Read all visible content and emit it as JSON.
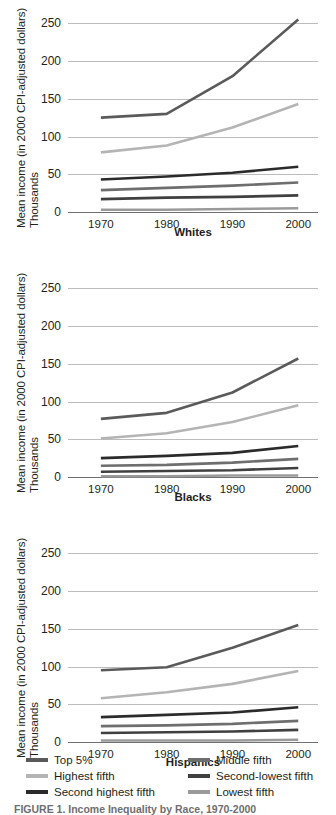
{
  "figure": {
    "y_axis_label_line1": "Mean income (in 2000 CPI-adjusted dollars)",
    "y_axis_label_line2": "Thousands",
    "caption": "FIGURE 1. Income Inequality by Race, 1970-2000"
  },
  "legend": {
    "items": [
      {
        "label": "Top 5%",
        "color": "#5a5a5a",
        "column": "left"
      },
      {
        "label": "Highest fifth",
        "color": "#b4b4b4",
        "column": "left"
      },
      {
        "label": "Second highest fifth",
        "color": "#2b2b2b",
        "column": "left"
      },
      {
        "label": "Middle fifth",
        "color": "#6e6e6e",
        "column": "right"
      },
      {
        "label": "Second-lowest fifth",
        "color": "#404040",
        "column": "right"
      },
      {
        "label": "Lowest fifth",
        "color": "#9a9a9a",
        "column": "right"
      }
    ]
  },
  "chart_data": [
    {
      "type": "line",
      "title": "Whites",
      "xlabel": "",
      "ylabel": "Mean income (in 2000 CPI-adjusted dollars) Thousands",
      "x": [
        1970,
        1980,
        1990,
        2000
      ],
      "xticklabels": [
        "1970",
        "1980",
        "1990",
        "2000"
      ],
      "yticks": [
        0,
        50,
        100,
        150,
        200,
        250
      ],
      "yticklabels": [
        "0",
        "50",
        "100",
        "150",
        "200",
        "250"
      ],
      "ylim": [
        0,
        265
      ],
      "xlim": [
        1965,
        2003
      ],
      "grid": true,
      "legend_position": "bottom",
      "series": [
        {
          "name": "Top 5%",
          "color": "#5a5a5a",
          "width": 2.6,
          "values": [
            125,
            130,
            180,
            255
          ]
        },
        {
          "name": "Highest fifth",
          "color": "#b4b4b4",
          "width": 2.6,
          "values": [
            79,
            88,
            112,
            143
          ]
        },
        {
          "name": "Second highest fifth",
          "color": "#2b2b2b",
          "width": 2.6,
          "values": [
            43,
            47,
            52,
            60
          ]
        },
        {
          "name": "Middle fifth",
          "color": "#6e6e6e",
          "width": 2.6,
          "values": [
            29,
            32,
            35,
            39
          ]
        },
        {
          "name": "Second-lowest fifth",
          "color": "#404040",
          "width": 2.6,
          "values": [
            17,
            19,
            20,
            22
          ]
        },
        {
          "name": "Lowest fifth",
          "color": "#9a9a9a",
          "width": 2.6,
          "values": [
            3,
            3,
            4,
            5
          ]
        }
      ]
    },
    {
      "type": "line",
      "title": "Blacks",
      "xlabel": "",
      "ylabel": "Mean income (in 2000 CPI-adjusted dollars) Thousands",
      "x": [
        1970,
        1980,
        1990,
        2000
      ],
      "xticklabels": [
        "1970",
        "1980",
        "1990",
        "2000"
      ],
      "yticks": [
        0,
        50,
        100,
        150,
        200,
        250
      ],
      "yticklabels": [
        "0",
        "50",
        "100",
        "150",
        "200",
        "250"
      ],
      "ylim": [
        0,
        265
      ],
      "xlim": [
        1965,
        2003
      ],
      "grid": true,
      "legend_position": "bottom",
      "series": [
        {
          "name": "Top 5%",
          "color": "#5a5a5a",
          "width": 2.6,
          "values": [
            77,
            85,
            112,
            157
          ]
        },
        {
          "name": "Highest fifth",
          "color": "#b4b4b4",
          "width": 2.6,
          "values": [
            51,
            58,
            73,
            95
          ]
        },
        {
          "name": "Second highest fifth",
          "color": "#2b2b2b",
          "width": 2.6,
          "values": [
            25,
            28,
            32,
            41
          ]
        },
        {
          "name": "Middle fifth",
          "color": "#6e6e6e",
          "width": 2.6,
          "values": [
            15,
            16,
            19,
            24
          ]
        },
        {
          "name": "Second-lowest fifth",
          "color": "#404040",
          "width": 2.6,
          "values": [
            7,
            8,
            9,
            12
          ]
        },
        {
          "name": "Lowest fifth",
          "color": "#9a9a9a",
          "width": 2.6,
          "values": [
            1,
            1,
            2,
            2
          ]
        }
      ]
    },
    {
      "type": "line",
      "title": "Hispanics",
      "xlabel": "",
      "ylabel": "Mean income (in 2000 CPI-adjusted dollars) Thousands",
      "x": [
        1970,
        1980,
        1990,
        2000
      ],
      "xticklabels": [
        "1970",
        "1980",
        "1990",
        "2000"
      ],
      "yticks": [
        0,
        50,
        100,
        150,
        200,
        250
      ],
      "yticklabels": [
        "0",
        "50",
        "100",
        "150",
        "200",
        "250"
      ],
      "ylim": [
        0,
        265
      ],
      "xlim": [
        1965,
        2003
      ],
      "grid": true,
      "legend_position": "bottom",
      "series": [
        {
          "name": "Top 5%",
          "color": "#5a5a5a",
          "width": 2.6,
          "values": [
            95,
            99,
            125,
            155
          ]
        },
        {
          "name": "Highest fifth",
          "color": "#b4b4b4",
          "width": 2.6,
          "values": [
            58,
            66,
            77,
            94
          ]
        },
        {
          "name": "Second highest fifth",
          "color": "#2b2b2b",
          "width": 2.6,
          "values": [
            33,
            36,
            39,
            46
          ]
        },
        {
          "name": "Middle fifth",
          "color": "#6e6e6e",
          "width": 2.6,
          "values": [
            21,
            22,
            24,
            28
          ]
        },
        {
          "name": "Second-lowest fifth",
          "color": "#404040",
          "width": 2.6,
          "values": [
            12,
            13,
            14,
            16
          ]
        },
        {
          "name": "Lowest fifth",
          "color": "#9a9a9a",
          "width": 2.6,
          "values": [
            2,
            2,
            2,
            3
          ]
        }
      ]
    }
  ]
}
